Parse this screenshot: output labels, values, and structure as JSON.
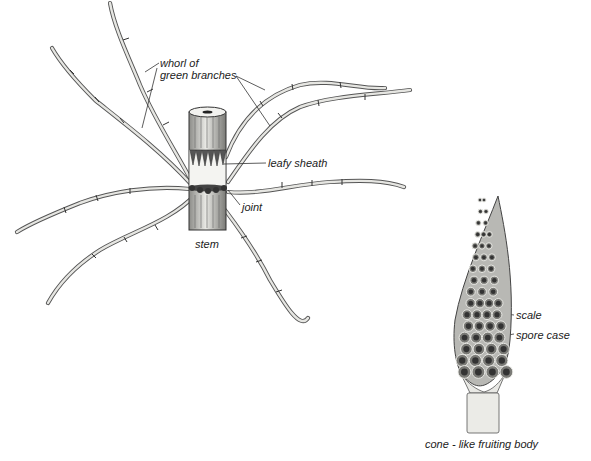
{
  "figure": {
    "labels": {
      "whorl": [
        "whorl of",
        "green branches"
      ],
      "leafy_sheath": "leafy sheath",
      "joint": "joint",
      "stem": "stem",
      "scale": "scale",
      "spore_case": "spore case",
      "cone_caption": "cone - like fruiting body"
    },
    "colors": {
      "background": "#ffffff",
      "ink": "#222222",
      "branch_fill": "#e6e6e2",
      "stem_shade": "#9a9a96",
      "cone_cell": "#555555"
    }
  }
}
